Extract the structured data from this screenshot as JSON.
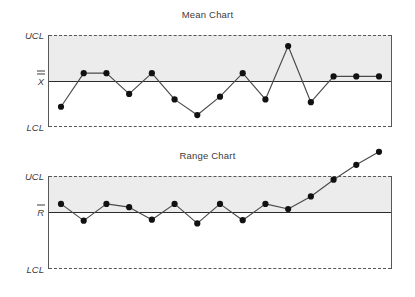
{
  "charts": {
    "mean": {
      "title": "Mean Chart",
      "label_ucl": "UCL",
      "label_center": "X",
      "label_lcl": "LCL"
    },
    "range": {
      "title": "Range Chart",
      "label_ucl": "UCL",
      "label_center": "R",
      "label_lcl": "LCL"
    }
  },
  "colors": {
    "band": "#ececec",
    "limit_line": "#55565a",
    "center_line": "#2b2b2b",
    "series_line": "#4a4a4a",
    "marker": "#111111",
    "text": "#3d3d3d"
  },
  "chart_data": [
    {
      "type": "line",
      "title": "Mean Chart",
      "xlabel": "",
      "ylabel": "",
      "ylim": [
        0,
        1
      ],
      "grid": false,
      "legend": "none",
      "annotations": [
        "UCL",
        "X̅̅",
        "LCL"
      ],
      "reference_lines": [
        {
          "name": "UCL",
          "value": 1.0,
          "style": "dashed"
        },
        {
          "name": "X-double-bar",
          "value": 0.5,
          "style": "solid"
        },
        {
          "name": "LCL",
          "value": 0.0,
          "style": "dashed"
        }
      ],
      "shaded_region": {
        "from": 0.5,
        "to": 1.0
      },
      "x": [
        1,
        2,
        3,
        4,
        5,
        6,
        7,
        8,
        9,
        10,
        11,
        12,
        13,
        14,
        15
      ],
      "values": [
        0.22,
        0.585,
        0.585,
        0.36,
        0.585,
        0.3,
        0.13,
        0.33,
        0.585,
        0.3,
        0.88,
        0.27,
        0.55,
        0.55,
        0.55
      ],
      "series": [
        {
          "name": "Sample mean",
          "values": [
            0.22,
            0.585,
            0.585,
            0.36,
            0.585,
            0.3,
            0.13,
            0.33,
            0.585,
            0.3,
            0.88,
            0.27,
            0.55,
            0.55,
            0.55
          ]
        }
      ],
      "out_of_control_points": []
    },
    {
      "type": "line",
      "title": "Range Chart",
      "xlabel": "",
      "ylabel": "",
      "ylim": [
        0,
        1
      ],
      "grid": false,
      "legend": "none",
      "annotations": [
        "UCL",
        "R̅",
        "LCL"
      ],
      "reference_lines": [
        {
          "name": "UCL",
          "value": 1.0,
          "style": "dashed"
        },
        {
          "name": "R-bar",
          "value": 0.61,
          "style": "solid"
        },
        {
          "name": "LCL",
          "value": 0.0,
          "style": "dashed"
        }
      ],
      "shaded_region": {
        "from": 0.61,
        "to": 1.0
      },
      "x": [
        1,
        2,
        3,
        4,
        5,
        6,
        7,
        8,
        9,
        10,
        11,
        12,
        13,
        14,
        15
      ],
      "values": [
        0.7,
        0.52,
        0.7,
        0.665,
        0.53,
        0.7,
        0.49,
        0.7,
        0.525,
        0.7,
        0.645,
        0.78,
        0.96,
        1.12,
        1.26
      ],
      "series": [
        {
          "name": "Sample range",
          "values": [
            0.7,
            0.52,
            0.7,
            0.665,
            0.53,
            0.7,
            0.49,
            0.7,
            0.525,
            0.7,
            0.645,
            0.78,
            0.96,
            1.12,
            1.26
          ]
        }
      ],
      "out_of_control_points": [
        14,
        15
      ]
    }
  ]
}
